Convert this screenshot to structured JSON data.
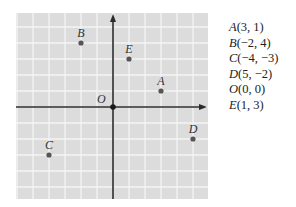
{
  "figure": {
    "type": "coordinate-plane",
    "background_color": "#ffffff",
    "grid_fill_color": "#dcdcdc",
    "grid_line_color": "#f4f4f4",
    "axis_color": "#2b2b2b",
    "point_color": "#555555",
    "label_color": "#333333"
  },
  "plot": {
    "origin_label": "O",
    "grid_range": {
      "x": [
        -6,
        6
      ],
      "y": [
        -6,
        6
      ]
    },
    "points": [
      {
        "label": "A",
        "x": 3,
        "y": 1
      },
      {
        "label": "B",
        "x": -2,
        "y": 4
      },
      {
        "label": "C",
        "x": -4,
        "y": -3
      },
      {
        "label": "D",
        "x": 5,
        "y": -2
      },
      {
        "label": "E",
        "x": 1,
        "y": 3
      }
    ]
  },
  "legend": {
    "items": [
      {
        "letter": "A",
        "coords": "(3, 1)"
      },
      {
        "letter": "B",
        "coords": "(−2, 4)"
      },
      {
        "letter": "C",
        "coords": "(−4, −3)"
      },
      {
        "letter": "D",
        "coords": "(5, −2)"
      },
      {
        "letter": "O",
        "coords": "(0, 0)"
      },
      {
        "letter": "E",
        "coords": "(1, 3)"
      }
    ]
  }
}
